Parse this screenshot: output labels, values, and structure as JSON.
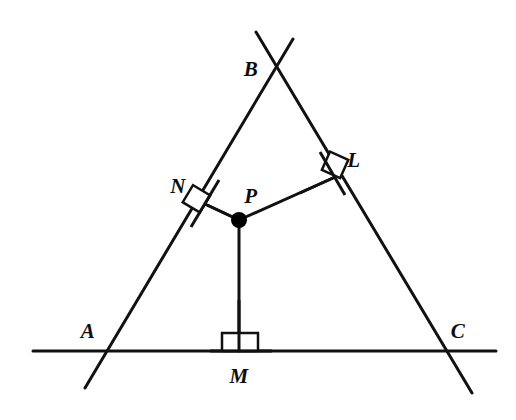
{
  "figure": {
    "type": "euclidean-geometry-diagram",
    "canvas": {
      "width": 516,
      "height": 420,
      "background": "#ffffff"
    },
    "style": {
      "line_color": "#111111",
      "line_width": 3,
      "point_color": "#000000",
      "right_angle_mark_color": "#111111",
      "right_angle_mark_width": 2.5,
      "label_color": "#0d0d0d"
    },
    "labels": [
      {
        "id": "A",
        "text": "A",
        "x": 88,
        "y": 331
      },
      {
        "id": "B",
        "text": "B",
        "x": 251,
        "y": 69
      },
      {
        "id": "C",
        "text": "C",
        "x": 458,
        "y": 331
      },
      {
        "id": "L",
        "text": "L",
        "x": 354,
        "y": 160
      },
      {
        "id": "M",
        "text": "M",
        "x": 239,
        "y": 376
      },
      {
        "id": "N",
        "text": "N",
        "x": 178,
        "y": 186
      },
      {
        "id": "P",
        "text": "P",
        "x": 251,
        "y": 196
      }
    ],
    "points": [
      {
        "id": "A",
        "x": 108,
        "y": 350,
        "marked": false
      },
      {
        "id": "B",
        "x": 277,
        "y": 68,
        "marked": false
      },
      {
        "id": "C",
        "x": 444,
        "y": 352,
        "marked": false
      },
      {
        "id": "P",
        "x": 239,
        "y": 220,
        "marked": true,
        "radius": 8
      },
      {
        "id": "L",
        "x": 333,
        "y": 178,
        "marked": false
      },
      {
        "id": "M",
        "x": 239,
        "y": 350,
        "marked": false
      },
      {
        "id": "N",
        "x": 205,
        "y": 204,
        "marked": false
      }
    ],
    "lines": [
      {
        "id": "line-AB",
        "name": "line-through-A-and-B",
        "x1": 85,
        "y1": 388,
        "x2": 293,
        "y2": 39
      },
      {
        "id": "line-BC",
        "name": "line-through-B-and-C",
        "x1": 256,
        "y1": 32,
        "x2": 472,
        "y2": 393
      },
      {
        "id": "line-AC",
        "name": "line-through-A-and-C",
        "x1": 33,
        "y1": 351,
        "x2": 496,
        "y2": 351
      }
    ],
    "segments": [
      {
        "id": "seg-PN",
        "name": "perpendicular-P-to-N",
        "x1": 239,
        "y1": 220,
        "x2": 205,
        "y2": 204
      },
      {
        "id": "seg-PL",
        "name": "perpendicular-P-to-L",
        "x1": 239,
        "y1": 220,
        "x2": 333,
        "y2": 178
      },
      {
        "id": "seg-PM",
        "name": "perpendicular-P-to-M",
        "x1": 239,
        "y1": 220,
        "x2": 239,
        "y2": 351
      }
    ],
    "right_angle_marks": [
      {
        "id": "ra-N",
        "at": "N",
        "cx": 205,
        "cy": 204,
        "size": 20,
        "rotation": -59
      },
      {
        "id": "ra-L",
        "at": "L",
        "cx": 331,
        "cy": 173,
        "size": 20,
        "rotation": 24
      },
      {
        "id": "ra-M",
        "at": "M",
        "cx": 240,
        "cy": 341,
        "size": 20,
        "rotation": 0
      }
    ]
  }
}
